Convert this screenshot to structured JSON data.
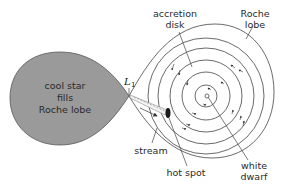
{
  "diagram": {
    "star": {
      "label_lines": [
        "cool star",
        "fills",
        "Roche lobe"
      ],
      "fill_color": "#9a9a9a"
    },
    "lagrange_point": {
      "label": "L",
      "subscript": "1"
    },
    "labels": {
      "accretion_disk": [
        "accretion",
        "disk"
      ],
      "roche_lobe": [
        "Roche",
        "lobe"
      ],
      "stream": "stream",
      "hot_spot": "hot spot",
      "white_dwarf": [
        "white",
        "dwarf"
      ]
    },
    "colors": {
      "line": "#444444",
      "hot_spot": "#1a1a1a",
      "background": "#ffffff"
    }
  }
}
